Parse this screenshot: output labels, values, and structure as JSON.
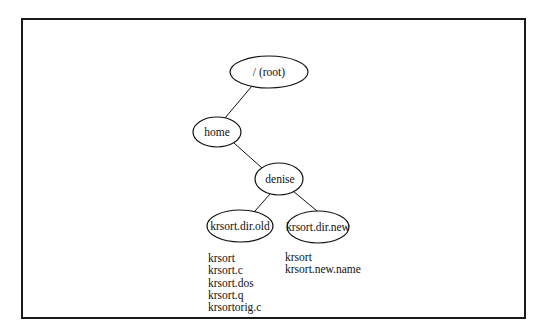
{
  "diagram": {
    "type": "directory-tree",
    "nodes": {
      "root": {
        "label": "/ (root)",
        "cx": 269,
        "cy": 72,
        "rx": 39,
        "ry": 16
      },
      "home": {
        "label": "home",
        "cx": 217,
        "cy": 132,
        "rx": 24,
        "ry": 15
      },
      "denise": {
        "label": "denise",
        "cx": 279,
        "cy": 179,
        "rx": 24,
        "ry": 16
      },
      "old": {
        "label": "krsort.dir.old",
        "cx": 240,
        "cy": 226,
        "rx": 33,
        "ry": 16
      },
      "new": {
        "label": "krsort.dir.new",
        "cx": 318,
        "cy": 227,
        "rx": 31,
        "ry": 16
      }
    },
    "edges": [
      {
        "from": "root",
        "to": "home"
      },
      {
        "from": "home",
        "to": "denise"
      },
      {
        "from": "denise",
        "to": "old"
      },
      {
        "from": "denise",
        "to": "new"
      }
    ],
    "files": {
      "old": [
        "krsort",
        "krsort.c",
        "krsort.dos",
        "krsort.q",
        "krsortorig.c"
      ],
      "new": [
        "krsort",
        "krsort.new.name"
      ]
    }
  }
}
